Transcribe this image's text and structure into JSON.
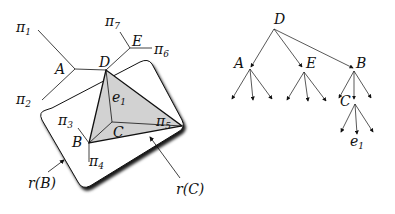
{
  "left_figure": {
    "labels": {
      "pi1": "π",
      "pi1_sub": "1",
      "pi2": "π",
      "pi2_sub": "2",
      "pi3": "π",
      "pi3_sub": "3",
      "pi4": "π",
      "pi4_sub": "4",
      "pi5": "π",
      "pi5_sub": "5",
      "pi6": "π",
      "pi6_sub": "6",
      "pi7": "π",
      "pi7_sub": "7",
      "A": "A",
      "B": "B",
      "C": "C",
      "D": "D",
      "E": "E",
      "e1": "e",
      "e1_sub": "1",
      "rB": "r(B)",
      "rC": "r(C)"
    }
  },
  "right_figure": {
    "nodes": {
      "D": "D",
      "A": "A",
      "E": "E",
      "B": "B",
      "C": "C",
      "e1": "e",
      "e1_sub": "1"
    }
  }
}
